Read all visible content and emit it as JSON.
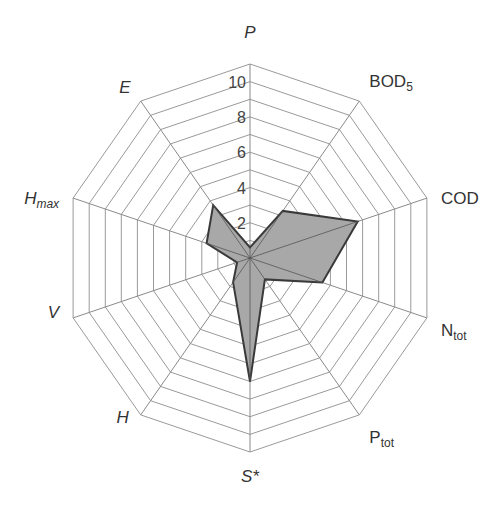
{
  "chart_data": {
    "type": "radar",
    "title": "",
    "axes": [
      {
        "key": "P",
        "main": "P",
        "sub": "",
        "italic": true
      },
      {
        "key": "BOD5",
        "main": "BOD",
        "sub": "5",
        "italic": false
      },
      {
        "key": "COD",
        "main": "COD",
        "sub": "",
        "italic": false
      },
      {
        "key": "Ntot",
        "main": "N",
        "sub": "tot",
        "italic": false
      },
      {
        "key": "Ptot",
        "main": "P",
        "sub": "tot",
        "italic": false
      },
      {
        "key": "S*",
        "main": "S*",
        "sub": "",
        "italic": true
      },
      {
        "key": "H",
        "main": "H",
        "sub": "",
        "italic": true
      },
      {
        "key": "V",
        "main": "V",
        "sub": "",
        "italic": true
      },
      {
        "key": "Hmax",
        "main": "H",
        "sub": "max",
        "italic": true
      },
      {
        "key": "E",
        "main": "E",
        "sub": "",
        "italic": true
      }
    ],
    "series": [
      {
        "name": "series-1",
        "values": [
          0.6,
          3.3,
          6.7,
          4.5,
          1.5,
          7.0,
          1.7,
          0.8,
          2.7,
          3.7
        ]
      }
    ],
    "radial_range": [
      0,
      11
    ],
    "grid_step": 1,
    "tick_labels": [
      "2",
      "4",
      "6",
      "8",
      "10"
    ],
    "tick_values": [
      2,
      4,
      6,
      8,
      10
    ],
    "grid": true,
    "legend": "none",
    "colors": {
      "fill": "#a8a8a8",
      "stroke": "#3a3a3a",
      "grid": "#9a9a9a"
    }
  }
}
